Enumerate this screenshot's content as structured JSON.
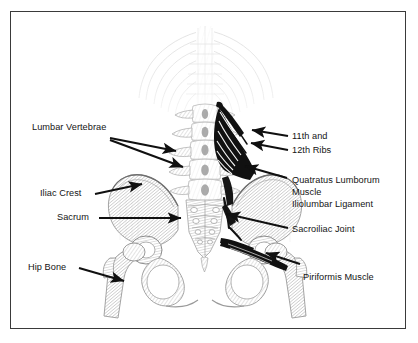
{
  "figure": {
    "kind": "anatomical-illustration",
    "border_color": "#3a3a3a",
    "background_color": "#ffffff",
    "ink_color": "#141414"
  },
  "labels": {
    "lumbar_vertebrae": "Lumbar Vertebrae",
    "iliac_crest": "Iliac Crest",
    "sacrum": "Sacrum",
    "hip_bone": "Hip Bone",
    "ribs_line1": "11th and",
    "ribs_line2": "12th Ribs",
    "quatratus_line1": "Quatratus Lumborum",
    "quatratus_line2": "Muscle",
    "iliolumbar_ligament": "Iliolumbar Ligament",
    "sacroiliac_joint": "Sacroiliac Joint",
    "piriformis_muscle": "Piriformis Muscle"
  },
  "anatomy_parts": {
    "quadratus_lumborum_muscle": "dark fan-shaped muscle, right side",
    "piriformis_muscle": "dark wedge across right sacroiliac region",
    "iliolumbar_ligament": "dark band at right sacral ala",
    "sacrum": "central triangular bone",
    "ilium": "broad flaring hip blades",
    "femur": "paired long bones descending",
    "rib_cage": "faint ribs above, fading to white",
    "lumbar_vertebrae": "stacked central vertebral column"
  }
}
